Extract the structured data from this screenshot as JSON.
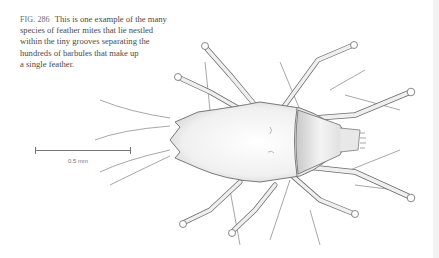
{
  "caption": {
    "figure_label": "FIG. 286",
    "lines": [
      "This is one example of the many",
      "species of feather mites that lie nestled",
      "within the tiny grooves separating the",
      "hundreds of barbules that make up",
      "a single feather."
    ]
  },
  "scale_bar": {
    "label": "0.5 mm"
  },
  "illustration": {
    "subject": "feather mite (dorsal view)",
    "ink_color": "#6b6b6b",
    "shade_color": "#d9d9d9"
  }
}
